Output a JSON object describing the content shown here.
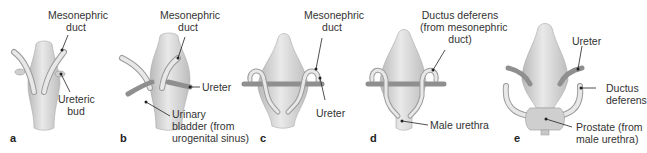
{
  "figure": {
    "panels": [
      {
        "letter": "a",
        "labels": {
          "mesonephric_duct_1": "Mesonephric",
          "mesonephric_duct_2": "duct",
          "ureteric_bud_1": "Ureteric",
          "ureteric_bud_2": "bud"
        }
      },
      {
        "letter": "b",
        "labels": {
          "mesonephric_duct_1": "Mesonephric",
          "mesonephric_duct_2": "duct",
          "ureter": "Ureter",
          "bladder_1": "Urinary",
          "bladder_2": "bladder (from",
          "bladder_3": "urogenital sinus)"
        }
      },
      {
        "letter": "c",
        "labels": {
          "mesonephric_duct_1": "Mesonephric",
          "mesonephric_duct_2": "duct",
          "ureter": "Ureter"
        }
      },
      {
        "letter": "d",
        "labels": {
          "ductus_1": "Ductus deferens",
          "ductus_2": "(from mesonephric",
          "ductus_3": "duct)",
          "male_urethra": "Male urethra"
        }
      },
      {
        "letter": "e",
        "labels": {
          "ureter": "Ureter",
          "ductus_1": "Ductus",
          "ductus_2": "deferens",
          "prostate_1": "Prostate (from",
          "prostate_2": "male urethra)"
        }
      }
    ],
    "colors": {
      "organ_fill": "#dcdcdc",
      "organ_shade": "#b8b8b8",
      "duct_fill": "#e6e6e6",
      "leader_line": "#222222"
    }
  }
}
